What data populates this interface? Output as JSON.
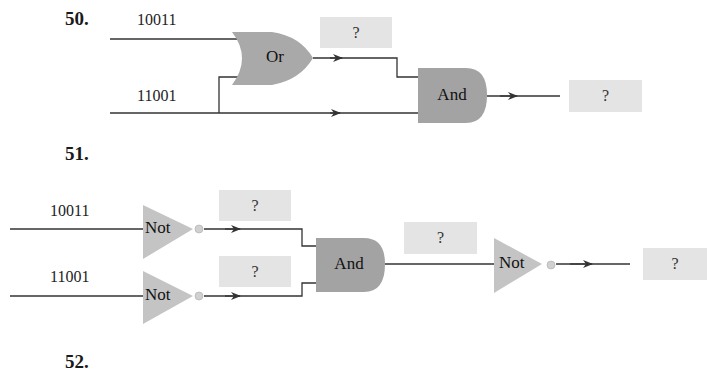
{
  "problems": [
    {
      "number": "50.",
      "inputs": [
        "10011",
        "11001"
      ],
      "gates": [
        {
          "type": "Or",
          "label": "Or"
        },
        {
          "type": "And",
          "label": "And"
        }
      ],
      "unknowns": [
        "?",
        "?"
      ]
    },
    {
      "number": "51.",
      "inputs": [
        "10011",
        "11001"
      ],
      "gates": [
        {
          "type": "Not",
          "label": "Not"
        },
        {
          "type": "Not",
          "label": "Not"
        },
        {
          "type": "And",
          "label": "And"
        },
        {
          "type": "Not",
          "label": "Not"
        }
      ],
      "unknowns": [
        "?",
        "?",
        "?",
        "?"
      ]
    },
    {
      "number": "52."
    }
  ],
  "colors": {
    "gate_fill": "#a9a9a9",
    "not_fill": "#c4c4c4",
    "box_fill": "#e4e4e4",
    "wire": "#333333"
  }
}
